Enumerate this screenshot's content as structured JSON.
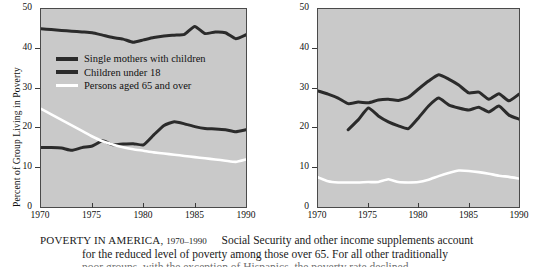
{
  "chart_data": [
    {
      "type": "line",
      "id": "poverty-by-family-type",
      "title": "",
      "xlabel": "",
      "ylabel": "Percent of Group Living in Poverty",
      "xlim": [
        1970,
        1990
      ],
      "ylim": [
        0,
        50
      ],
      "xticks": [
        1970,
        1975,
        1980,
        1985,
        1990
      ],
      "yticks": [
        0,
        10,
        20,
        30,
        40,
        50
      ],
      "grid": false,
      "legend_position": "upper-left-inside",
      "plot_background": "#c9c9c9",
      "series": [
        {
          "name": "Single mothers with children",
          "color": "#2b2b2b",
          "x": [
            1970,
            1971,
            1972,
            1973,
            1974,
            1975,
            1976,
            1977,
            1978,
            1979,
            1980,
            1981,
            1982,
            1983,
            1984,
            1985,
            1986,
            1987,
            1988,
            1989,
            1990
          ],
          "values": [
            45.0,
            44.8,
            44.6,
            44.4,
            44.2,
            44.0,
            43.4,
            42.8,
            42.4,
            41.6,
            42.2,
            42.8,
            43.2,
            43.4,
            43.6,
            45.6,
            43.8,
            44.2,
            44.0,
            42.5,
            43.5
          ]
        },
        {
          "name": "Children under 18",
          "color": "#2b2b2b",
          "x": [
            1970,
            1971,
            1972,
            1973,
            1974,
            1975,
            1976,
            1977,
            1978,
            1979,
            1980,
            1981,
            1982,
            1983,
            1984,
            1985,
            1986,
            1987,
            1988,
            1989,
            1990
          ],
          "values": [
            15.0,
            15.0,
            14.9,
            14.3,
            15.0,
            15.4,
            16.7,
            15.7,
            15.9,
            16.0,
            15.7,
            18.2,
            20.6,
            21.5,
            21.0,
            20.3,
            19.8,
            19.7,
            19.5,
            19.0,
            19.5
          ]
        },
        {
          "name": "Persons aged 65 and over",
          "color": "#ffffff",
          "x": [
            1970,
            1971,
            1972,
            1973,
            1974,
            1975,
            1976,
            1977,
            1978,
            1979,
            1980,
            1981,
            1982,
            1983,
            1984,
            1985,
            1986,
            1987,
            1988,
            1989,
            1990
          ],
          "values": [
            24.8,
            23.4,
            22.0,
            20.6,
            19.2,
            17.8,
            16.6,
            15.8,
            15.1,
            14.6,
            14.2,
            13.8,
            13.5,
            13.2,
            12.9,
            12.6,
            12.3,
            12.0,
            11.7,
            11.4,
            12.0
          ]
        }
      ]
    },
    {
      "type": "line",
      "id": "poverty-by-race",
      "title": "",
      "xlabel": "",
      "ylabel": "Percent of Group Living in Poverty",
      "xlim": [
        1970,
        1990
      ],
      "ylim": [
        0,
        50
      ],
      "xticks": [
        1970,
        1975,
        1980,
        1985,
        1990
      ],
      "yticks": [
        0,
        10,
        20,
        30,
        40,
        50
      ],
      "grid": false,
      "legend_position": "upper-left-inside",
      "plot_background": "#c9c9c9",
      "series": [
        {
          "name": "Black",
          "color": "#2b2b2b",
          "x": [
            1970,
            1971,
            1972,
            1973,
            1974,
            1975,
            1976,
            1977,
            1978,
            1979,
            1980,
            1981,
            1982,
            1983,
            1984,
            1985,
            1986,
            1987,
            1988,
            1989,
            1990
          ],
          "values": [
            29.3,
            28.5,
            27.5,
            26.1,
            26.5,
            26.3,
            27.0,
            27.2,
            26.9,
            27.7,
            29.8,
            31.8,
            33.4,
            32.3,
            30.8,
            28.8,
            29.0,
            27.2,
            28.6,
            26.8,
            28.5
          ]
        },
        {
          "name": "Hispanic",
          "color": "#2b2b2b",
          "x": [
            1973,
            1974,
            1975,
            1976,
            1977,
            1978,
            1979,
            1980,
            1981,
            1982,
            1983,
            1984,
            1985,
            1986,
            1987,
            1988,
            1989,
            1990
          ],
          "values": [
            19.5,
            22.0,
            25.0,
            23.0,
            21.5,
            20.5,
            19.8,
            22.5,
            25.5,
            27.5,
            25.8,
            25.0,
            24.5,
            25.2,
            24.0,
            25.5,
            23.2,
            22.2,
            24.0
          ]
        },
        {
          "name": "White",
          "color": "#ffffff",
          "x": [
            1970,
            1971,
            1972,
            1973,
            1974,
            1975,
            1976,
            1977,
            1978,
            1979,
            1980,
            1981,
            1982,
            1983,
            1984,
            1985,
            1986,
            1987,
            1988,
            1989,
            1990
          ],
          "values": [
            7.5,
            6.5,
            6.2,
            6.2,
            6.2,
            6.3,
            6.3,
            7.0,
            6.3,
            6.2,
            6.3,
            6.9,
            7.8,
            8.6,
            9.2,
            9.1,
            8.8,
            8.4,
            7.9,
            7.6,
            7.2,
            7.0
          ]
        }
      ]
    }
  ],
  "panels": {
    "left": {
      "ylabel": "Percent of Group Living in Poverty",
      "yticks": [
        "50",
        "40",
        "30",
        "20",
        "10",
        "0"
      ],
      "xticks": [
        "1970",
        "1975",
        "1980",
        "1985",
        "1990"
      ],
      "legend": [
        {
          "label": "Single mothers with children",
          "color": "#2b2b2b"
        },
        {
          "label": "Children under 18",
          "color": "#2b2b2b"
        },
        {
          "label": "Persons aged 65 and over",
          "color": "#ffffff"
        }
      ]
    },
    "right": {
      "ylabel": "Percent of Group Living in Poverty",
      "yticks": [
        "50",
        "40",
        "30",
        "20",
        "10",
        "0"
      ],
      "xticks": [
        "1970",
        "1975",
        "1980",
        "1985",
        "1990"
      ],
      "legend": [
        {
          "label": "Black",
          "color": "#2b2b2b"
        },
        {
          "label": "Hispanic",
          "color": "#2b2b2b"
        },
        {
          "label": "White",
          "color": "#ffffff"
        }
      ]
    }
  },
  "caption": {
    "title": "POVERTY IN AMERICA,",
    "years": "1970–1990",
    "line1": "Social Security and other income supplements account",
    "line2": "for the reduced level of poverty among those over 65. For all other traditionally",
    "line3": "poor groups, with the exception of Hispanics, the poverty rate declined"
  }
}
